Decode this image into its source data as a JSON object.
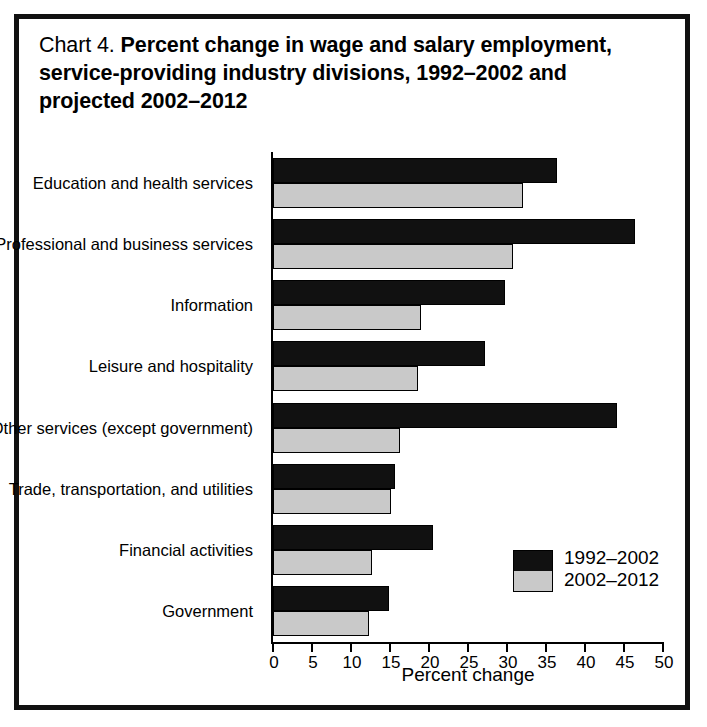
{
  "chart_data": {
    "type": "bar",
    "orientation": "horizontal",
    "title": "Chart 4. Percent change in wage and salary employment, service-providing industry divisions, 1992–2002 and projected 2002–2012",
    "title_number": "Chart 4.",
    "title_text": "Percent change in wage and salary employment, service-providing industry divisions, 1992–2002 and projected 2002–2012",
    "xlabel": "Percent change",
    "ylabel": "",
    "xlim": [
      0,
      50
    ],
    "xticks": [
      0,
      5,
      10,
      15,
      20,
      25,
      30,
      35,
      40,
      45,
      50
    ],
    "xtick_labels": [
      "0",
      "5",
      "10",
      "15",
      "20",
      "25",
      "30",
      "35",
      "40",
      "45",
      "50"
    ],
    "grid": false,
    "legend_position": "inside-lower-right",
    "categories": [
      "Education and health services",
      "Professional and business services",
      "Information",
      "Leisure and hospitality",
      "Other services (except government)",
      "Trade, transportation, and utilities",
      "Financial activities",
      "Government"
    ],
    "series": [
      {
        "name": "1992–2002",
        "color": "#111111",
        "values": [
          36.4,
          46.4,
          29.7,
          27.2,
          44.1,
          15.6,
          20.5,
          14.9
        ]
      },
      {
        "name": "2002–2012",
        "color": "#c9c9c9",
        "values": [
          32.0,
          30.8,
          19.0,
          18.6,
          16.3,
          15.1,
          12.7,
          12.3
        ]
      }
    ]
  },
  "legend": {
    "entries": [
      {
        "label": "1992–2002",
        "color": "#111111"
      },
      {
        "label": "2002–2012",
        "color": "#c9c9c9"
      }
    ]
  },
  "colors": {
    "frame": "#111111",
    "series_1992_2002": "#111111",
    "series_2002_2012": "#c9c9c9",
    "axis": "#000000",
    "background": "#ffffff"
  }
}
